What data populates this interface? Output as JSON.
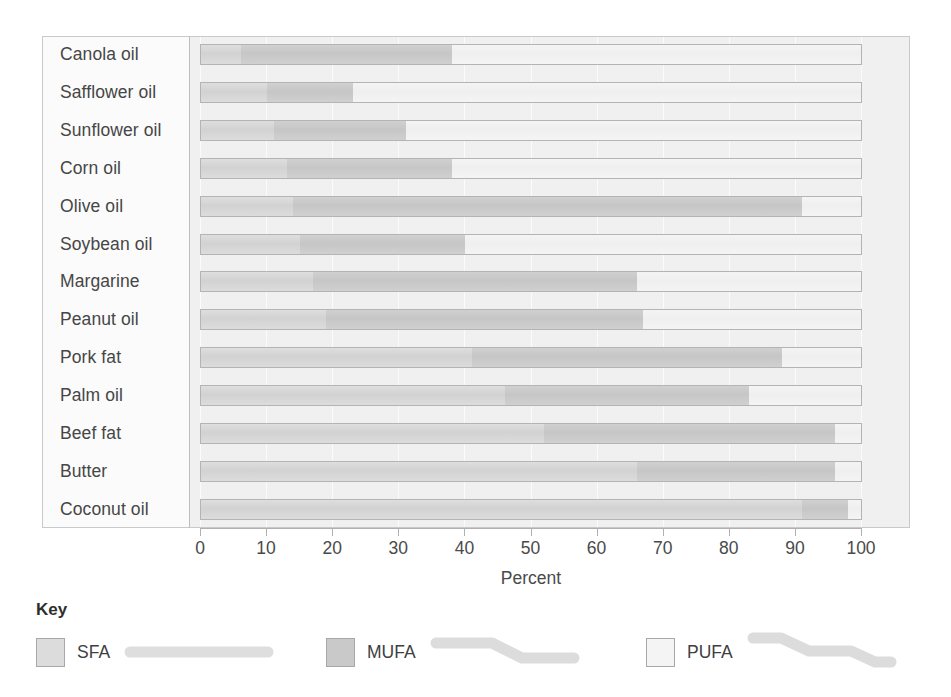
{
  "chart_data": {
    "type": "bar",
    "orientation": "horizontal",
    "stacked": true,
    "title": "",
    "xlabel": "Percent",
    "ylabel": "",
    "xlim": [
      0,
      100
    ],
    "xticks": [
      0,
      10,
      20,
      30,
      40,
      50,
      60,
      70,
      80,
      90,
      100
    ],
    "grid": true,
    "legend_position": "bottom",
    "legend_title": "Key",
    "categories": [
      "Canola oil",
      "Safflower oil",
      "Sunflower oil",
      "Corn oil",
      "Olive oil",
      "Soybean oil",
      "Margarine",
      "Peanut oil",
      "Pork fat",
      "Palm oil",
      "Beef fat",
      "Butter",
      "Coconut oil"
    ],
    "series": [
      {
        "name": "SFA",
        "color": "#d6d6d6",
        "values": [
          6,
          10,
          11,
          13,
          14,
          15,
          17,
          19,
          41,
          46,
          52,
          66,
          91
        ]
      },
      {
        "name": "MUFA",
        "color": "#c8c8c8",
        "values": [
          32,
          13,
          20,
          25,
          77,
          25,
          49,
          48,
          47,
          37,
          44,
          30,
          7
        ]
      },
      {
        "name": "PUFA",
        "color": "#f2f2f2",
        "values": [
          62,
          77,
          69,
          62,
          9,
          60,
          34,
          33,
          12,
          17,
          4,
          4,
          2
        ]
      }
    ]
  },
  "axis": {
    "title": "Percent",
    "ticks": [
      "0",
      "10",
      "20",
      "30",
      "40",
      "50",
      "60",
      "70",
      "80",
      "90",
      "100"
    ]
  },
  "legend": {
    "title": "Key",
    "items": [
      {
        "label": "SFA",
        "icon": "straight-chain-icon",
        "swatch_color": "#dcdcdc"
      },
      {
        "label": "MUFA",
        "icon": "one-bend-chain-icon",
        "swatch_color": "#c9c9c9"
      },
      {
        "label": "PUFA",
        "icon": "two-bend-chain-icon",
        "swatch_color": "#f4f4f4"
      }
    ]
  }
}
